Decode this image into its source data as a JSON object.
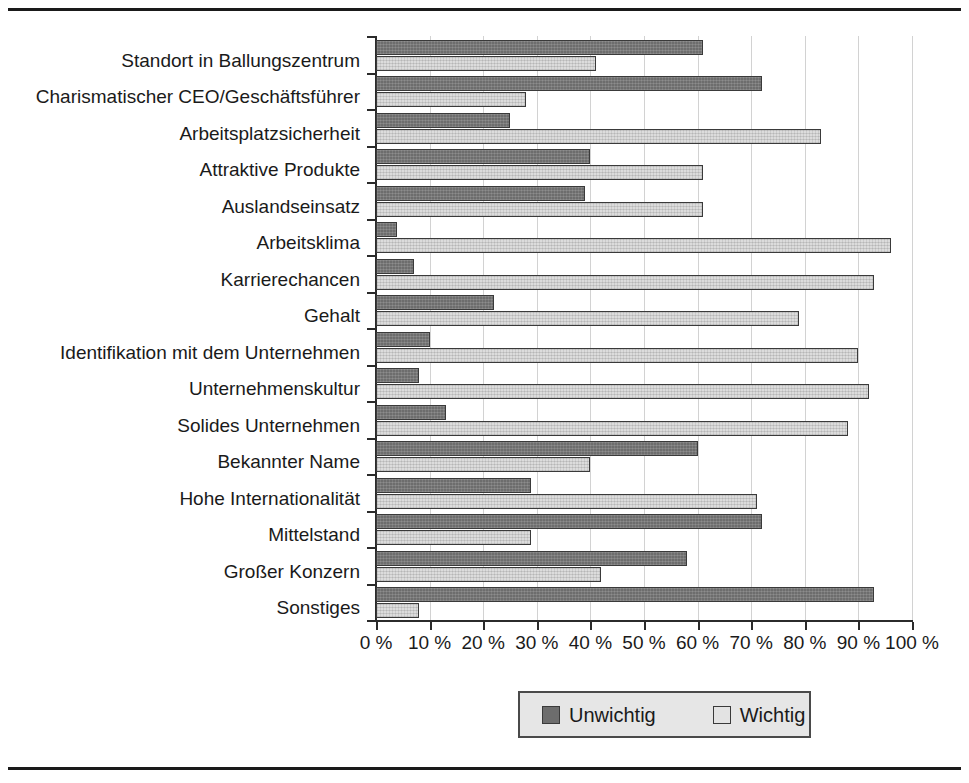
{
  "chart_data": {
    "type": "bar",
    "orientation": "horizontal",
    "grouping": "grouped",
    "title": "",
    "xlabel": "",
    "ylabel": "",
    "xlim": [
      0,
      100
    ],
    "grid": "vertical",
    "legend_position": "bottom-center",
    "categories": [
      "Standort in Ballungszentrum",
      "Charismatischer CEO/Geschäftsführer",
      "Arbeitsplatzsicherheit",
      "Attraktive Produkte",
      "Auslandseinsatz",
      "Arbeitsklima",
      "Karrierechancen",
      "Gehalt",
      "Identifikation mit dem Unternehmen",
      "Unternehmenskultur",
      "Solides Unternehmen",
      "Bekannter Name",
      "Hohe Internationalität",
      "Mittelstand",
      "Großer Konzern",
      "Sonstiges"
    ],
    "series": [
      {
        "name": "Unwichtig",
        "color": "#6d6d6d",
        "values": [
          61,
          72,
          25,
          40,
          39,
          4,
          7,
          22,
          10,
          8,
          13,
          60,
          29,
          72,
          58,
          93
        ]
      },
      {
        "name": "Wichtig",
        "color": "#dcdcdc",
        "values": [
          41,
          28,
          83,
          61,
          61,
          96,
          93,
          79,
          90,
          92,
          88,
          40,
          71,
          29,
          42,
          8
        ]
      }
    ],
    "xticks": [
      0,
      10,
      20,
      30,
      40,
      50,
      60,
      70,
      80,
      90,
      100
    ],
    "xtick_labels": [
      "0 %",
      "10 %",
      "20 %",
      "30 %",
      "40 %",
      "50 %",
      "60 %",
      "70 %",
      "80 %",
      "90 %",
      "100 %"
    ]
  },
  "legend": {
    "items": [
      {
        "label": "Unwichtig",
        "swatch": "dark-gray-swatch-icon"
      },
      {
        "label": "Wichtig",
        "swatch": "light-gray-swatch-icon"
      }
    ]
  }
}
